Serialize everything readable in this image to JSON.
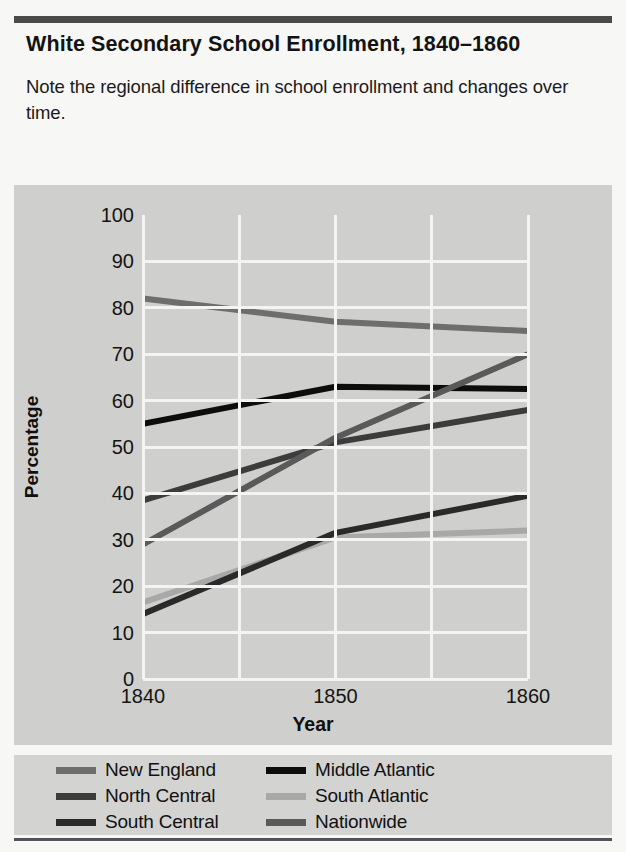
{
  "figure": {
    "title": "White Secondary School Enrollment, 1840–1860",
    "caption": "Note the regional difference in school enrollment and changes over time."
  },
  "chart_data": {
    "type": "line",
    "title": "White Secondary School Enrollment, 1840–1860",
    "xlabel": "Year",
    "ylabel": "Percentage",
    "x": [
      1840,
      1850,
      1860
    ],
    "xtick_labels": [
      "1840",
      "1850",
      "1860"
    ],
    "ytick_labels": [
      "0",
      "10",
      "20",
      "30",
      "40",
      "50",
      "60",
      "70",
      "80",
      "90",
      "100"
    ],
    "yticks": [
      0,
      10,
      20,
      30,
      40,
      50,
      60,
      70,
      80,
      90,
      100
    ],
    "ylim": [
      0,
      100
    ],
    "grid": true,
    "legend_position": "below",
    "series": [
      {
        "name": "New England",
        "values": [
          82,
          77,
          75
        ],
        "color": "#6e6e6e"
      },
      {
        "name": "Middle Atlantic",
        "values": [
          55,
          63,
          62.5
        ],
        "color": "#0d0d0d"
      },
      {
        "name": "North Central",
        "values": [
          38.5,
          51,
          58
        ],
        "color": "#3c3c3c"
      },
      {
        "name": "South Atlantic",
        "values": [
          16.5,
          30.5,
          32
        ],
        "color": "#a8a8a8"
      },
      {
        "name": "South Central",
        "values": [
          14,
          31.5,
          39.5
        ],
        "color": "#2a2a2a"
      },
      {
        "name": "Nationwide",
        "values": [
          29,
          52,
          70
        ],
        "color": "#5a5a5a"
      }
    ]
  },
  "legend": {
    "items": [
      {
        "label": "New England",
        "color": "#6e6e6e"
      },
      {
        "label": "Middle Atlantic",
        "color": "#0d0d0d"
      },
      {
        "label": "North Central",
        "color": "#3c3c3c"
      },
      {
        "label": "South Atlantic",
        "color": "#a8a8a8"
      },
      {
        "label": "South Central",
        "color": "#2a2a2a"
      },
      {
        "label": "Nationwide",
        "color": "#5a5a5a"
      }
    ],
    "order": [
      0,
      1,
      2,
      3,
      4,
      5
    ]
  },
  "colors": {
    "panel_bg": "#cfcfcd",
    "gridline": "#f4f4f2",
    "rule": "#4a4a4a",
    "page_bg": "#f7f7f5"
  }
}
